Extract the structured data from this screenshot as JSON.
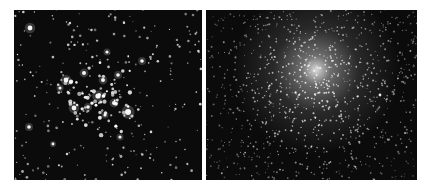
{
  "figure": {
    "panels": [
      {
        "id": "left",
        "subject": "open star cluster",
        "description": "Sparse field of bright, well-separated stars with a loose concentration near the center",
        "background": "#0b0b0b"
      },
      {
        "id": "right",
        "subject": "globular cluster",
        "description": "Dense, spherically concentrated swarm of faint stars with a bright unresolved core",
        "background": "#0b0b0b"
      }
    ],
    "page_background": "#ffffff"
  }
}
